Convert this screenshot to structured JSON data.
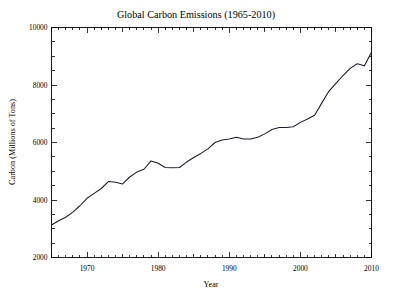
{
  "chart_data": {
    "type": "line",
    "title": "Global Carbon Emissions (1965-2010)",
    "xlabel": "Year",
    "ylabel": "Carbon (Millions of Tons)",
    "xlim": [
      1965,
      2010
    ],
    "ylim": [
      2000,
      10000
    ],
    "grid": false,
    "legend": null,
    "line_color": "#1a1a2e",
    "x_ticks_major": [
      1970,
      1980,
      1990,
      2000,
      2010
    ],
    "x_tick_labels": [
      "1970",
      "1980",
      "1990",
      "2000",
      "2010"
    ],
    "x_ticks_minor_step": 1,
    "y_ticks_major": [
      2000,
      4000,
      6000,
      8000,
      10000
    ],
    "y_tick_labels": [
      "2000",
      "4000",
      "6000",
      "8000",
      "10000"
    ],
    "y_ticks_minor_step": 500,
    "x": [
      1965,
      1966,
      1967,
      1968,
      1969,
      1970,
      1971,
      1972,
      1973,
      1974,
      1975,
      1976,
      1977,
      1978,
      1979,
      1980,
      1981,
      1982,
      1983,
      1984,
      1985,
      1986,
      1987,
      1988,
      1989,
      1990,
      1991,
      1992,
      1993,
      1994,
      1995,
      1996,
      1997,
      1998,
      1999,
      2000,
      2001,
      2002,
      2003,
      2004,
      2005,
      2006,
      2007,
      2008,
      2009,
      2010
    ],
    "values": [
      3130,
      3280,
      3400,
      3580,
      3800,
      4060,
      4230,
      4400,
      4640,
      4620,
      4560,
      4800,
      4970,
      5070,
      5360,
      5280,
      5130,
      5120,
      5130,
      5320,
      5480,
      5620,
      5780,
      6000,
      6090,
      6120,
      6180,
      6120,
      6120,
      6180,
      6300,
      6450,
      6520,
      6520,
      6550,
      6700,
      6820,
      6950,
      7370,
      7780,
      8060,
      8330,
      8580,
      8740,
      8670,
      9140
    ],
    "series_name": "Global carbon emissions"
  },
  "figure": {
    "background_color": "#ffffff",
    "frame_color": "#000000"
  }
}
